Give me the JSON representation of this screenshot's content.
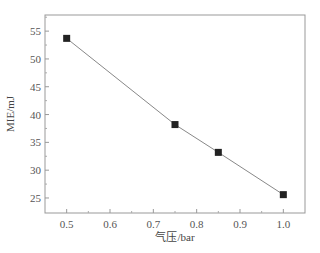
{
  "chart_data": {
    "type": "line",
    "title": "",
    "xlabel": "气压/bar",
    "ylabel": "MIE/mJ",
    "x": [
      0.5,
      0.75,
      0.85,
      1.0
    ],
    "series": [
      {
        "name": "MIE",
        "values": [
          53.7,
          38.2,
          33.2,
          25.6
        ],
        "marker": "square",
        "color": "#222222",
        "line_color": "#888888"
      }
    ],
    "xlim": [
      0.45,
      1.05
    ],
    "ylim": [
      22.3,
      57.9
    ],
    "xticks": [
      0.5,
      0.6,
      0.7,
      0.8,
      0.9,
      1.0
    ],
    "xtick_labels": [
      "0.5",
      "0.6",
      "0.7",
      "0.8",
      "0.9",
      "1.0"
    ],
    "yticks": [
      25,
      30,
      35,
      40,
      45,
      50,
      55
    ],
    "ytick_labels": [
      "25",
      "30",
      "35",
      "40",
      "45",
      "50",
      "55"
    ],
    "grid": false,
    "legend": null
  }
}
